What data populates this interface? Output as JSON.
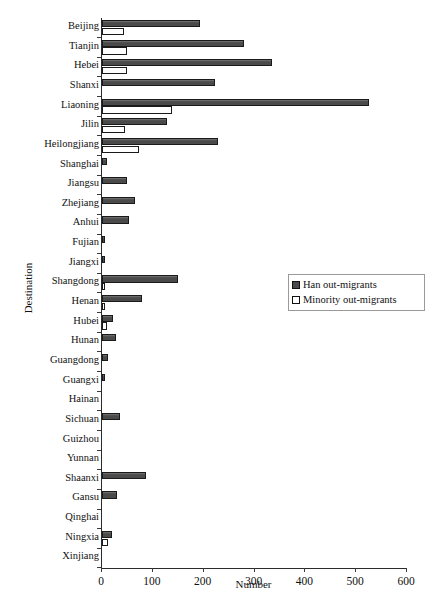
{
  "chart_data": {
    "type": "bar",
    "orientation": "horizontal",
    "title": "",
    "xlabel": "Number",
    "ylabel": "Destination",
    "xlim": [
      0,
      600
    ],
    "xticks": [
      0,
      100,
      200,
      300,
      400,
      500,
      600
    ],
    "grid": false,
    "legend_position": "center-right",
    "categories": [
      "Beijing",
      "Tianjin",
      "Hebei",
      "Shanxi",
      "Liaoning",
      "Jilin",
      "Heilongjiang",
      "Shanghai",
      "Jiangsu",
      "Zhejiang",
      "Anhui",
      "Fujian",
      "Jiangxi",
      "Shangdong",
      "Henan",
      "Hubei",
      "Hunan",
      "Guangdong",
      "Guangxi",
      "Hainan",
      "Sichuan",
      "Guizhou",
      "Yunnan",
      "Shaanxi",
      "Gansu",
      "Qinghai",
      "Ningxia",
      "Xinjiang"
    ],
    "series": [
      {
        "name": "Han out-migrants",
        "color": "#4a4a4a",
        "values": [
          193,
          280,
          335,
          222,
          526,
          128,
          229,
          10,
          50,
          65,
          53,
          5,
          5,
          150,
          78,
          22,
          28,
          11,
          4,
          0,
          36,
          0,
          0,
          87,
          30,
          0,
          20,
          0
        ]
      },
      {
        "name": "Minority out-migrants",
        "color": "#ffffff",
        "values": [
          43,
          49,
          49,
          0,
          138,
          46,
          72,
          0,
          0,
          0,
          0,
          0,
          0,
          5,
          5,
          10,
          0,
          0,
          0,
          0,
          0,
          0,
          0,
          0,
          0,
          0,
          11,
          0
        ]
      }
    ]
  },
  "legend": {
    "items": [
      {
        "label": "Han out-migrants",
        "marker": "filled-square"
      },
      {
        "label": "Minority  out-migrants",
        "marker": "empty-square"
      }
    ]
  },
  "axis": {
    "xlabel": "Number",
    "ylabel": "Destination",
    "xtick_labels": [
      "0",
      "100",
      "200",
      "300",
      "400",
      "500",
      "600"
    ]
  },
  "caption": {
    "text": ""
  }
}
